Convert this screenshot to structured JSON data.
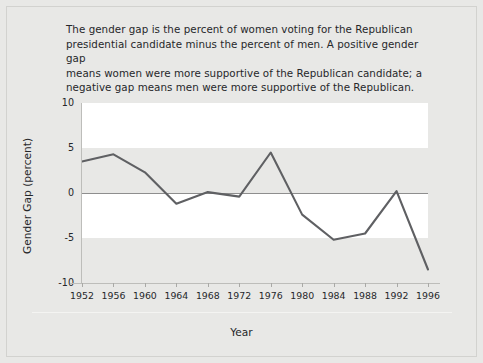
{
  "caption": {
    "lines": [
      "The gender gap is the percent of women voting for the Republican",
      "presidential candidate minus the percent of men. A positive gender gap",
      "means women were more supportive of the Republican candidate; a",
      "negative gap means men were more supportive of the Republican."
    ]
  },
  "colors": {
    "page_background": "#e8e8e6",
    "band_light": "#ffffff",
    "band_dark": "#e8e8e6",
    "series_line": "#5f6063",
    "zero_line": "#8e8e8e",
    "axis_line": "#bdbdba",
    "text": "#26272a"
  },
  "chart_data": {
    "type": "line",
    "title": "",
    "xlabel": "Year",
    "ylabel": "Gender Gap (percent)",
    "categories": [
      1952,
      1956,
      1960,
      1964,
      1968,
      1972,
      1976,
      1980,
      1984,
      1988,
      1992,
      1996
    ],
    "x_tick_labels": [
      "1952",
      "1956",
      "1960",
      "1964",
      "1968",
      "1972",
      "1976",
      "1980",
      "1984",
      "1988",
      "1992",
      "1996"
    ],
    "values": [
      3.5,
      4.3,
      2.3,
      -1.2,
      0.1,
      -0.4,
      4.5,
      -2.4,
      -5.2,
      -4.5,
      0.2,
      -8.5
    ],
    "series": [
      {
        "name": "Gender gap",
        "values": [
          3.5,
          4.3,
          2.3,
          -1.2,
          0.1,
          -0.4,
          4.5,
          -2.4,
          -5.2,
          -4.5,
          0.2,
          -8.5
        ]
      }
    ],
    "ylim": [
      -10,
      10
    ],
    "y_tick_labels": [
      "10",
      "5",
      "0",
      "-5",
      "-10"
    ],
    "y_tick_values": [
      10,
      5,
      0,
      -5,
      -10
    ],
    "xlim": [
      1952,
      1996
    ],
    "grid": false,
    "banded_background": true,
    "zero_reference_line": true,
    "legend": null,
    "legend_position": "none",
    "annotations": []
  }
}
